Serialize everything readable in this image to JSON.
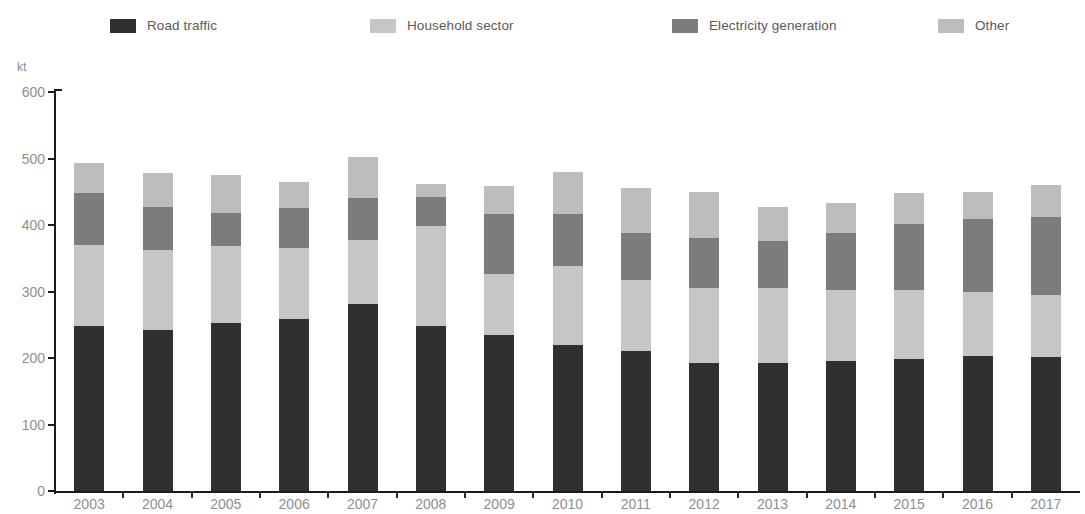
{
  "chart_data": {
    "type": "bar",
    "stacked": true,
    "title": "",
    "subtitle": "",
    "xlabel": "",
    "ylabel": "kt",
    "unit_label": "kt",
    "ylim": [
      0,
      600
    ],
    "ytick_values": [
      0,
      100,
      200,
      300,
      400,
      500,
      600
    ],
    "ytick_labels": [
      "0",
      "100",
      "200",
      "300",
      "400",
      "500",
      "600"
    ],
    "grid": false,
    "legend_position": "top",
    "categories": [
      "2003",
      "2004",
      "2005",
      "2006",
      "2007",
      "2008",
      "2009",
      "2010",
      "2011",
      "2012",
      "2013",
      "2014",
      "2015",
      "2016",
      "2017"
    ],
    "series": [
      {
        "name": "Road traffic",
        "color": "#303030",
        "values": [
          248,
          242,
          252,
          259,
          281,
          248,
          235,
          219,
          210,
          192,
          192,
          195,
          198,
          203,
          202
        ]
      },
      {
        "name": "Household sector",
        "color": "#c6c6c6",
        "values": [
          122,
          121,
          116,
          106,
          97,
          150,
          91,
          119,
          108,
          113,
          113,
          108,
          104,
          96,
          93
        ]
      },
      {
        "name": "Electricity generation",
        "color": "#7c7c7c",
        "values": [
          78,
          64,
          50,
          61,
          63,
          44,
          90,
          78,
          70,
          75,
          71,
          85,
          100,
          110,
          117
        ]
      },
      {
        "name": "Other",
        "color": "#bdbdbd",
        "values": [
          45,
          52,
          57,
          38,
          61,
          20,
          43,
          64,
          67,
          70,
          51,
          45,
          46,
          40,
          48
        ]
      }
    ],
    "totals": [
      493,
      479,
      475,
      464,
      502,
      462,
      459,
      480,
      455,
      450,
      427,
      433,
      448,
      449,
      460
    ]
  },
  "legend": {
    "items": [
      {
        "label": "Road traffic",
        "color": "#303030",
        "x": 110
      },
      {
        "label": "Household sector",
        "color": "#c6c6c6",
        "x": 370
      },
      {
        "label": "Electricity generation",
        "color": "#7c7c7c",
        "x": 672
      },
      {
        "label": "Other",
        "color": "#bdbdbd",
        "x": 938
      }
    ]
  },
  "axis": {
    "unit": "kt",
    "axis_color": "#1a1a1a",
    "tick_label_color": "#8e8e8e"
  }
}
